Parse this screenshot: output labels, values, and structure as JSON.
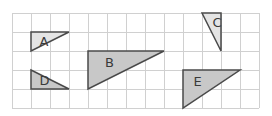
{
  "diagram": {
    "type": "grid-with-triangles",
    "grid": {
      "cols": 13,
      "rows": 5,
      "origin_x": 12,
      "origin_y": 13,
      "cell": 19,
      "line_color": "#d0d0d0"
    },
    "shapes": [
      {
        "label": "A",
        "fill": "#e4e4e4",
        "points": [
          [
            1,
            1
          ],
          [
            3,
            1
          ],
          [
            1,
            2
          ]
        ],
        "label_pos": [
          1.45,
          1.72
        ]
      },
      {
        "label": "B",
        "fill": "#c8c8c8",
        "points": [
          [
            4,
            2
          ],
          [
            8,
            2
          ],
          [
            4,
            4
          ]
        ],
        "label_pos": [
          4.9,
          2.85
        ]
      },
      {
        "label": "C",
        "fill": "#e4e4e4",
        "points": [
          [
            10,
            0
          ],
          [
            11,
            0
          ],
          [
            11,
            2
          ]
        ],
        "label_pos": [
          10.55,
          0.72
        ]
      },
      {
        "label": "D",
        "fill": "#c8c8c8",
        "points": [
          [
            1,
            3
          ],
          [
            3,
            4
          ],
          [
            1,
            4
          ]
        ],
        "label_pos": [
          1.45,
          3.8
        ]
      },
      {
        "label": "E",
        "fill": "#c8c8c8",
        "points": [
          [
            9,
            3
          ],
          [
            12,
            3
          ],
          [
            9,
            5
          ]
        ],
        "label_pos": [
          9.55,
          3.85
        ]
      }
    ],
    "stroke": "#4a4a4a"
  }
}
